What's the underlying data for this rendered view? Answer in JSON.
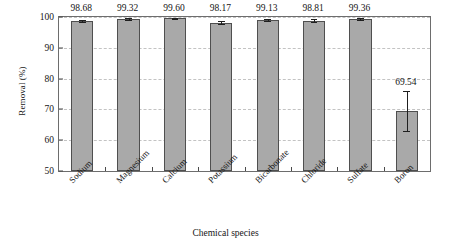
{
  "chart_data": {
    "type": "bar",
    "title": "",
    "xlabel": "Chemical species",
    "ylabel": "Removal (%)",
    "categories": [
      "Sodium",
      "Magnesium",
      "Calcium",
      "Potassium",
      "Bicarbonate",
      "Chloride",
      "Sulfate",
      "Boron"
    ],
    "values": [
      98.68,
      99.32,
      99.6,
      98.17,
      99.13,
      98.81,
      99.36,
      69.54
    ],
    "value_labels": [
      "98.68",
      "99.32",
      "99.60",
      "98.17",
      "99.13",
      "98.81",
      "99.36",
      "69.54"
    ],
    "errors": [
      0.35,
      0.3,
      0.22,
      0.4,
      0.32,
      0.45,
      0.33,
      6.5
    ],
    "ylim": [
      50,
      100
    ],
    "yticks": [
      50,
      60,
      70,
      80,
      90,
      100
    ],
    "ytick_labels": [
      "50",
      "60",
      "70",
      "80",
      "90",
      "100"
    ],
    "grid": true,
    "grid_style": "dashed",
    "legend": "none",
    "bar_fill_color": "#a9a9a9",
    "bar_edge_color": "#4f4f4f",
    "error_bar_color": "#1f1f1f",
    "grid_color": "#c3c3c3",
    "frame_color": "#6d6d6d",
    "background_color": "#ffffff",
    "xtick_label_rotation": -45
  }
}
